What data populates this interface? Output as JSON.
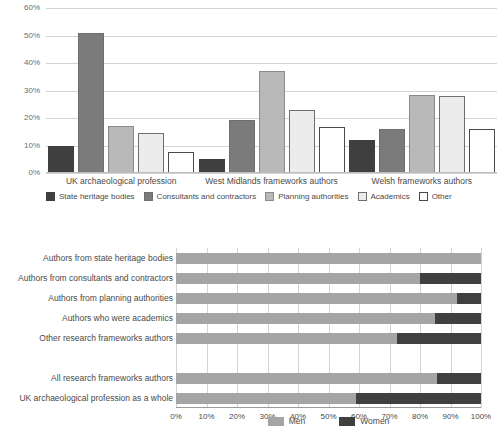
{
  "chart_data": [
    {
      "type": "bar",
      "title": "",
      "subtitle": "",
      "xlabel": "",
      "ylabel": "",
      "ylim": [
        0,
        60
      ],
      "ytick_labels": [
        "0%",
        "10%",
        "20%",
        "30%",
        "40%",
        "50%",
        "60%"
      ],
      "ytick_values": [
        0,
        10,
        20,
        30,
        40,
        50,
        60
      ],
      "grid": true,
      "legend_position": "bottom",
      "categories": [
        "UK archaeological profession",
        "West Midlands frameworks authors",
        "Welsh frameworks authors"
      ],
      "series": [
        {
          "name": "State heritage bodies",
          "color": "#3f3f3f",
          "border": "#3f3f3f",
          "values": [
            9.7,
            5.0,
            12.0
          ]
        },
        {
          "name": "Consultants and contractors",
          "color": "#7b7b7b",
          "border": "#6e6e6e",
          "values": [
            50.8,
            19.2,
            16.0
          ]
        },
        {
          "name": "Planning authorities",
          "color": "#b9b9b9",
          "border": "#8a8a8a",
          "values": [
            17.0,
            37.0,
            28.2
          ]
        },
        {
          "name": "Academics",
          "color": "#ececec",
          "border": "#6e6e6e",
          "values": [
            14.7,
            22.8,
            28.0
          ]
        },
        {
          "name": "Other",
          "color": "#ffffff",
          "border": "#4a4a4a",
          "values": [
            7.7,
            16.6,
            16.0
          ]
        }
      ]
    },
    {
      "type": "bar",
      "orientation": "horizontal",
      "stacked": true,
      "title": "",
      "xlabel": "",
      "ylabel": "",
      "xlim": [
        0,
        100
      ],
      "xtick_labels": [
        "0%",
        "10%",
        "20%",
        "30%",
        "40%",
        "50%",
        "60%",
        "70%",
        "80%",
        "90%",
        "100%"
      ],
      "xtick_values": [
        0,
        10,
        20,
        30,
        40,
        50,
        60,
        70,
        80,
        90,
        100
      ],
      "grid": true,
      "legend_position": "bottom",
      "categories": [
        "Authors from state heritage bodies",
        "Authors from consultants and contractors",
        "Authors from planning authorities",
        "Authors who were academics",
        "Other research frameworks authors",
        "",
        "All research frameworks authors",
        "UK archaeological profession as a whole"
      ],
      "series": [
        {
          "name": "Men",
          "color": "#a5a5a5",
          "values": [
            100,
            80,
            92,
            85,
            72.5,
            null,
            85.5,
            59
          ]
        },
        {
          "name": "Women",
          "color": "#404040",
          "values": [
            0,
            20,
            8,
            15,
            27.5,
            null,
            14.5,
            41
          ]
        }
      ]
    }
  ]
}
